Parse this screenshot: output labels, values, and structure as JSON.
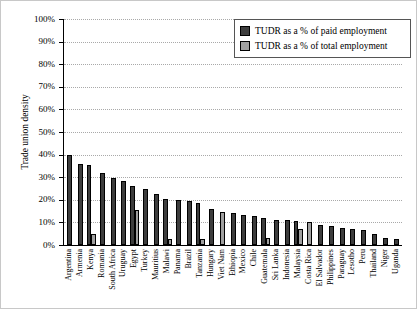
{
  "chart_data": {
    "type": "bar",
    "title": "",
    "ylabel": "Trade union density",
    "xlabel": "",
    "ylim": [
      0,
      100
    ],
    "yticks": [
      0,
      10,
      20,
      30,
      40,
      50,
      60,
      70,
      80,
      90,
      100
    ],
    "ytick_suffix": "%",
    "grid": "horizontal dotted",
    "legend_position": "top-right",
    "categories": [
      "Argentina",
      "Armenia",
      "Kenya",
      "Romania",
      "South Africa",
      "Uruguay",
      "Egypt",
      "Turkey",
      "Mauritius",
      "Malawi",
      "Panama",
      "Brazil",
      "Tanzania",
      "Hungary",
      "Viet Nam",
      "Ethiopia",
      "Mexico",
      "Chile",
      "Guatemala",
      "Sri Lanka",
      "Indonesia",
      "Malaysia",
      "Costa Rica",
      "El Salvador",
      "Philippines",
      "Paraguay",
      "Lesotho",
      "Peru",
      "Thailand",
      "Niger",
      "Uganda"
    ],
    "series": [
      {
        "name": "TUDR as a % of paid employment",
        "color": "#3d3d3d",
        "values": [
          40,
          36,
          35.5,
          32,
          29.5,
          28.5,
          26,
          25,
          22.5,
          20.5,
          20,
          19.5,
          18.5,
          16,
          null,
          14,
          13.5,
          13,
          12,
          11,
          11,
          10.5,
          null,
          9,
          8.5,
          7.5,
          7,
          6.5,
          5,
          3,
          2.5
        ]
      },
      {
        "name": "TUDR as a % of total employment",
        "color": "#a0a0a0",
        "values": [
          null,
          null,
          5,
          null,
          null,
          null,
          15.5,
          null,
          null,
          2.5,
          null,
          null,
          2.5,
          null,
          14.5,
          null,
          null,
          null,
          3,
          null,
          null,
          7,
          10,
          null,
          null,
          null,
          null,
          null,
          null,
          null,
          null
        ]
      }
    ]
  }
}
